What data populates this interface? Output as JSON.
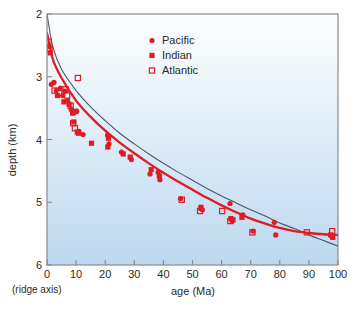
{
  "chart_data": {
    "type": "scatter",
    "title": "",
    "xlabel": "age (Ma)",
    "ylabel": "depth (km)",
    "xlim": [
      0,
      100
    ],
    "ylim": [
      2,
      6
    ],
    "y_inverted": true,
    "grid": false,
    "xticks": [
      0,
      10,
      20,
      30,
      40,
      50,
      60,
      70,
      80,
      90,
      100
    ],
    "xtick_labels": [
      "0",
      "10",
      "20",
      "30",
      "40",
      "50",
      "60",
      "70",
      "80",
      "90",
      "100"
    ],
    "yticks": [
      2,
      3,
      4,
      5,
      6
    ],
    "ytick_labels": [
      "2",
      "3",
      "4",
      "5",
      "6"
    ],
    "origin_annotation": "(ridge axis)",
    "legend_position": "top-center",
    "series": [
      {
        "name": "Pacific",
        "marker": "filled-circle",
        "color": "#e01b24",
        "points": [
          [
            0.8,
            2.52
          ],
          [
            1.5,
            3.12
          ],
          [
            2.4,
            3.09
          ],
          [
            3.2,
            3.22
          ],
          [
            4.6,
            3.18
          ],
          [
            5.4,
            3.3
          ],
          [
            6.2,
            3.23
          ],
          [
            7.1,
            3.38
          ],
          [
            8.3,
            3.52
          ],
          [
            9.4,
            3.57
          ],
          [
            10.2,
            3.55
          ],
          [
            11.0,
            3.87
          ],
          [
            12.4,
            3.92
          ],
          [
            20.8,
            3.93
          ],
          [
            21.3,
            4.07
          ],
          [
            25.6,
            4.2
          ],
          [
            29.0,
            4.32
          ],
          [
            35.4,
            4.55
          ],
          [
            38.2,
            4.52
          ],
          [
            38.8,
            4.64
          ],
          [
            45.9,
            4.94
          ],
          [
            52.8,
            5.1
          ],
          [
            53.4,
            5.12
          ],
          [
            62.9,
            5.02
          ],
          [
            63.6,
            5.3
          ],
          [
            67.3,
            5.2
          ],
          [
            70.8,
            5.46
          ],
          [
            78.1,
            5.32
          ],
          [
            78.6,
            5.52
          ],
          [
            97.8,
            5.54
          ]
        ]
      },
      {
        "name": "Indian",
        "marker": "filled-square",
        "color": "#e01b24",
        "points": [
          [
            1.1,
            2.62
          ],
          [
            3.6,
            3.3
          ],
          [
            5.8,
            3.4
          ],
          [
            7.6,
            3.44
          ],
          [
            8.8,
            3.58
          ],
          [
            9.2,
            3.72
          ],
          [
            9.8,
            3.55
          ],
          [
            10.4,
            3.88
          ],
          [
            10.8,
            3.9
          ],
          [
            15.3,
            4.06
          ],
          [
            20.9,
            4.12
          ],
          [
            21.1,
            3.98
          ],
          [
            26.2,
            4.23
          ],
          [
            28.6,
            4.28
          ],
          [
            35.8,
            4.48
          ],
          [
            38.6,
            4.58
          ],
          [
            52.9,
            5.08
          ],
          [
            63.2,
            5.26
          ],
          [
            63.9,
            5.28
          ],
          [
            67.0,
            5.24
          ],
          [
            97.5,
            5.52
          ],
          [
            98.2,
            5.56
          ]
        ]
      },
      {
        "name": "Atlantic",
        "marker": "open-square",
        "color": "#e01b24",
        "points": [
          [
            0.5,
            2.44
          ],
          [
            0.9,
            2.56
          ],
          [
            2.6,
            3.22
          ],
          [
            4.2,
            3.26
          ],
          [
            6.4,
            3.2
          ],
          [
            6.9,
            3.3
          ],
          [
            8.1,
            3.46
          ],
          [
            9.0,
            3.74
          ],
          [
            9.6,
            3.82
          ],
          [
            10.6,
            3.02
          ],
          [
            46.3,
            4.96
          ],
          [
            52.6,
            5.14
          ],
          [
            60.2,
            5.14
          ],
          [
            63.0,
            5.3
          ],
          [
            70.6,
            5.48
          ],
          [
            89.3,
            5.48
          ],
          [
            98.0,
            5.46
          ]
        ]
      }
    ],
    "curves": [
      {
        "name": "half-space-cooling-model",
        "style": "thin-dark",
        "color": "#4a5a6a",
        "description": "sqrt-age subsidence model continuing to deepen",
        "points": [
          [
            0,
            2.0
          ],
          [
            2,
            2.52
          ],
          [
            5,
            2.88
          ],
          [
            10,
            3.22
          ],
          [
            15,
            3.48
          ],
          [
            20,
            3.7
          ],
          [
            25,
            3.9
          ],
          [
            30,
            4.07
          ],
          [
            35,
            4.23
          ],
          [
            40,
            4.38
          ],
          [
            45,
            4.52
          ],
          [
            50,
            4.65
          ],
          [
            55,
            4.78
          ],
          [
            60,
            4.9
          ],
          [
            65,
            5.01
          ],
          [
            70,
            5.12
          ],
          [
            75,
            5.22
          ],
          [
            80,
            5.33
          ],
          [
            85,
            5.42
          ],
          [
            90,
            5.52
          ],
          [
            95,
            5.61
          ],
          [
            100,
            5.7
          ]
        ]
      },
      {
        "name": "plate-model",
        "style": "thick-red",
        "color": "#e01b24",
        "description": "plate model flattening toward constant depth",
        "points": [
          [
            0,
            2.3
          ],
          [
            2,
            2.72
          ],
          [
            5,
            3.02
          ],
          [
            10,
            3.38
          ],
          [
            15,
            3.64
          ],
          [
            20,
            3.86
          ],
          [
            25,
            4.05
          ],
          [
            30,
            4.22
          ],
          [
            35,
            4.38
          ],
          [
            40,
            4.53
          ],
          [
            45,
            4.67
          ],
          [
            50,
            4.8
          ],
          [
            55,
            4.93
          ],
          [
            60,
            5.05
          ],
          [
            65,
            5.16
          ],
          [
            70,
            5.26
          ],
          [
            75,
            5.34
          ],
          [
            80,
            5.41
          ],
          [
            85,
            5.46
          ],
          [
            90,
            5.49
          ],
          [
            95,
            5.51
          ],
          [
            100,
            5.52
          ]
        ]
      }
    ]
  },
  "legend": {
    "entries": [
      {
        "label": "Pacific",
        "marker": "filled-circle"
      },
      {
        "label": "Indian",
        "marker": "filled-square"
      },
      {
        "label": "Atlantic",
        "marker": "open-square"
      }
    ]
  },
  "colors": {
    "marker_red": "#e01b24",
    "curve_red": "#e01b24",
    "curve_dark": "#4a5a6a",
    "frame": "#8a8a8a",
    "background_top": "#fbfdfe",
    "background_bottom": "#bfd9ef",
    "text": "#2b2b2b"
  }
}
